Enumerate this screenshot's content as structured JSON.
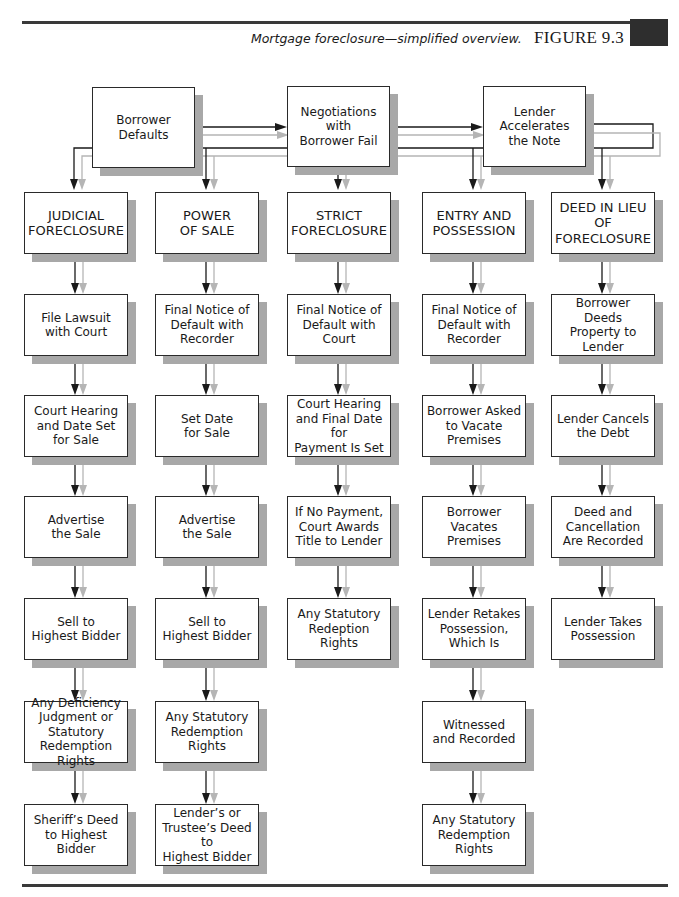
{
  "header": {
    "caption": "Mortgage foreclosure—simplified overview.",
    "figure_label": "FIGURE 9.3"
  },
  "top_flow": [
    {
      "id": "borrower-defaults",
      "label": "Borrower\nDefaults"
    },
    {
      "id": "negotiations-fail",
      "label": "Negotiations with\nBorrower Fail"
    },
    {
      "id": "lender-accelerates",
      "label": "Lender\nAccelerates\nthe Note"
    }
  ],
  "columns": [
    {
      "id": "judicial-foreclosure",
      "heading": "JUDICIAL\nFORECLOSURE",
      "steps": [
        "File Lawsuit\nwith Court",
        "Court Hearing\nand Date Set\nfor Sale",
        "Advertise\nthe Sale",
        "Sell to\nHighest Bidder",
        "Any Deficiency\nJudgment or\nStatutory\nRedemption Rights",
        "Sheriff’s Deed\nto Highest\nBidder"
      ]
    },
    {
      "id": "power-of-sale",
      "heading": "POWER\nOF SALE",
      "steps": [
        "Final Notice of\nDefault with\nRecorder",
        "Set Date\nfor Sale",
        "Advertise\nthe Sale",
        "Sell to\nHighest Bidder",
        "Any Statutory\nRedemption\nRights",
        "Lender’s or\nTrustee’s Deed to\nHighest Bidder"
      ]
    },
    {
      "id": "strict-foreclosure",
      "heading": "STRICT\nFORECLOSURE",
      "steps": [
        "Final Notice of\nDefault with\nCourt",
        "Court Hearing\nand Final Date for\nPayment Is Set",
        "If No Payment,\nCourt Awards\nTitle to Lender",
        "Any Statutory\nRedeption Rights"
      ]
    },
    {
      "id": "entry-and-possession",
      "heading": "ENTRY AND\nPOSSESSION",
      "steps": [
        "Final Notice of\nDefault with\nRecorder",
        "Borrower Asked\nto Vacate\nPremises",
        "Borrower\nVacates Premises",
        "Lender Retakes\nPossession,\nWhich Is",
        "Witnessed\nand Recorded",
        "Any Statutory\nRedemption\nRights"
      ]
    },
    {
      "id": "deed-in-lieu",
      "heading": "DEED IN LIEU OF\nFORECLOSURE",
      "steps": [
        "Borrower Deeds\nProperty to\nLender",
        "Lender Cancels\nthe Debt",
        "Deed and\nCancellation\nAre Recorded",
        "Lender Takes\nPossession"
      ]
    }
  ],
  "colors": {
    "line_dark": "#1a1a1a",
    "line_light": "#b5b5b5",
    "shadow": "#a8a8a8",
    "rule": "#3a3a3a"
  }
}
